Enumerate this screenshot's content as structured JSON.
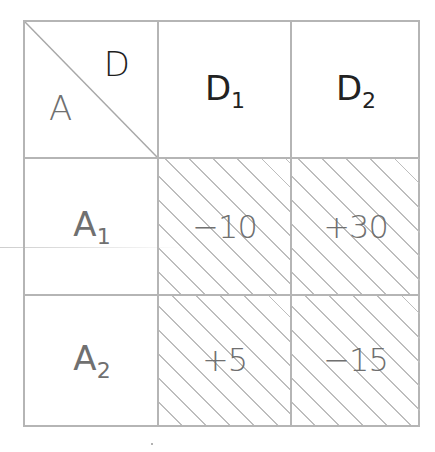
{
  "table": {
    "corner": {
      "row_header_label": "A",
      "column_header_label": "D"
    },
    "columns": [
      {
        "base": "D",
        "subscript": "1"
      },
      {
        "base": "D",
        "subscript": "2"
      }
    ],
    "rows": [
      {
        "header": {
          "base": "A",
          "subscript": "1"
        },
        "values": [
          "−10",
          "+30"
        ]
      },
      {
        "header": {
          "base": "A",
          "subscript": "2"
        },
        "values": [
          "+5",
          "−15"
        ]
      }
    ],
    "colors": {
      "grid_line": "#b5b5b5",
      "text": "#707070",
      "header_text": "#222222",
      "hatch": "#bdbdbd"
    }
  }
}
